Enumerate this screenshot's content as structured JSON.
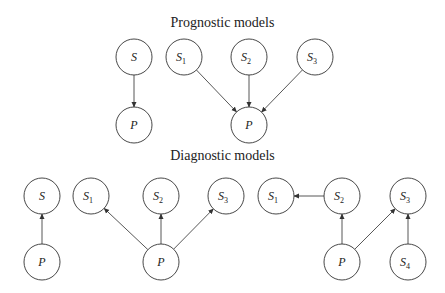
{
  "titles": {
    "prognostic": "Prognostic models",
    "diagnostic": "Diagnostic models"
  },
  "nodes": [
    {
      "id": "pS",
      "label": "S",
      "sub": "",
      "x": 134,
      "y": 57
    },
    {
      "id": "pP1",
      "label": "P",
      "sub": "",
      "x": 134,
      "y": 125
    },
    {
      "id": "pS1",
      "label": "S",
      "sub": "1",
      "x": 184,
      "y": 57
    },
    {
      "id": "pS2",
      "label": "S",
      "sub": "2",
      "x": 249,
      "y": 57
    },
    {
      "id": "pS3",
      "label": "S",
      "sub": "3",
      "x": 315,
      "y": 57
    },
    {
      "id": "pP2",
      "label": "P",
      "sub": "",
      "x": 249,
      "y": 125
    },
    {
      "id": "dS",
      "label": "S",
      "sub": "",
      "x": 42,
      "y": 196
    },
    {
      "id": "dP1",
      "label": "P",
      "sub": "",
      "x": 42,
      "y": 262
    },
    {
      "id": "dS1",
      "label": "S",
      "sub": "1",
      "x": 91,
      "y": 196
    },
    {
      "id": "dS2",
      "label": "S",
      "sub": "2",
      "x": 161,
      "y": 196
    },
    {
      "id": "dS3",
      "label": "S",
      "sub": "3",
      "x": 226,
      "y": 196
    },
    {
      "id": "dP2",
      "label": "P",
      "sub": "",
      "x": 161,
      "y": 262
    },
    {
      "id": "eS1",
      "label": "S",
      "sub": "1",
      "x": 276,
      "y": 196
    },
    {
      "id": "eS2",
      "label": "S",
      "sub": "2",
      "x": 342,
      "y": 196
    },
    {
      "id": "eS3",
      "label": "S",
      "sub": "3",
      "x": 408,
      "y": 196
    },
    {
      "id": "eP",
      "label": "P",
      "sub": "",
      "x": 342,
      "y": 262
    },
    {
      "id": "eS4",
      "label": "S",
      "sub": "4",
      "x": 408,
      "y": 262
    }
  ],
  "edges": [
    [
      "pS",
      "pP1"
    ],
    [
      "pS1",
      "pP2"
    ],
    [
      "pS2",
      "pP2"
    ],
    [
      "pS3",
      "pP2"
    ],
    [
      "dP1",
      "dS"
    ],
    [
      "dP2",
      "dS1"
    ],
    [
      "dP2",
      "dS2"
    ],
    [
      "dP2",
      "dS3"
    ],
    [
      "eS2",
      "eS1"
    ],
    [
      "eP",
      "eS2"
    ],
    [
      "eP",
      "eS3"
    ],
    [
      "eS4",
      "eS3"
    ]
  ]
}
